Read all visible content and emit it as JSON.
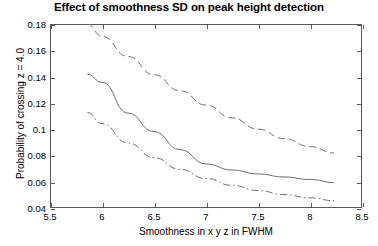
{
  "chart_data": {
    "type": "line",
    "title": "Effect of smoothness SD on peak height detection",
    "xlabel": "Smoothness in x y z in FWHM",
    "ylabel": "Probability of crossing z = 4.0",
    "xlim": [
      5.5,
      8.5
    ],
    "ylim": [
      0.04,
      0.18
    ],
    "xticks": [
      5.5,
      6,
      6.5,
      7,
      7.5,
      8,
      8.5
    ],
    "xticklabels": [
      "5.5",
      "6",
      "6.5",
      "7",
      "7.5",
      "8",
      "8.5"
    ],
    "yticks": [
      0.04,
      0.06,
      0.08,
      0.1,
      0.12,
      0.14,
      0.16,
      0.18
    ],
    "yticklabels": [
      "0.04",
      "0.06",
      "0.08",
      "0.1",
      "0.12",
      "0.14",
      "0.16",
      "0.18"
    ],
    "grid": false,
    "legend": null,
    "line_color": "#6e6e6e",
    "frame_color": "#5a5a5a",
    "series": [
      {
        "name": "upper-bound",
        "style": "dashed",
        "x": [
          5.86,
          6.0,
          6.25,
          6.5,
          6.75,
          7.0,
          7.25,
          7.5,
          7.75,
          8.0,
          8.23
        ],
        "y": [
          0.18,
          0.1706,
          0.1553,
          0.1414,
          0.1292,
          0.1183,
          0.1086,
          0.1,
          0.0928,
          0.0867,
          0.0819
        ]
      },
      {
        "name": "mean-estimate",
        "style": "solid",
        "x": [
          5.86,
          6.0,
          6.25,
          6.5,
          6.75,
          7.0,
          7.25,
          7.5,
          7.75,
          8.0,
          8.23
        ],
        "y": [
          0.1417,
          0.1356,
          0.1122,
          0.0981,
          0.0844,
          0.0735,
          0.0689,
          0.0659,
          0.0636,
          0.0617,
          0.0594
        ]
      },
      {
        "name": "lower-bound",
        "style": "dash-dot",
        "x": [
          5.86,
          6.0,
          6.25,
          6.5,
          6.75,
          7.0,
          7.25,
          7.5,
          7.75,
          8.0,
          8.23
        ],
        "y": [
          0.1126,
          0.1042,
          0.0895,
          0.0784,
          0.0694,
          0.0625,
          0.0573,
          0.0533,
          0.0502,
          0.0477,
          0.0456
        ]
      }
    ]
  }
}
